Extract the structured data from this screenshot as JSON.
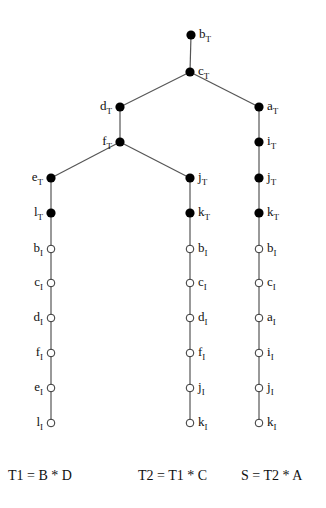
{
  "colors": {
    "line": "#555555",
    "filled_node": "#000000",
    "open_node_stroke": "#333333",
    "text": "#111111"
  },
  "nodes": [
    {
      "id": "bT",
      "letter": "b",
      "sub": "T",
      "x": 191,
      "y": 35,
      "filled": true,
      "label_side": "right"
    },
    {
      "id": "cT",
      "letter": "c",
      "sub": "T",
      "x": 190,
      "y": 72,
      "filled": true,
      "label_side": "right"
    },
    {
      "id": "dT",
      "letter": "d",
      "sub": "T",
      "x": 120,
      "y": 107,
      "filled": true,
      "label_side": "left"
    },
    {
      "id": "fT",
      "letter": "f",
      "sub": "T",
      "x": 120,
      "y": 142,
      "filled": true,
      "label_side": "left"
    },
    {
      "id": "eT",
      "letter": "e",
      "sub": "T",
      "x": 51,
      "y": 178,
      "filled": true,
      "label_side": "left"
    },
    {
      "id": "lT",
      "letter": "l",
      "sub": "T",
      "x": 51,
      "y": 213,
      "filled": true,
      "label_side": "left"
    },
    {
      "id": "bI1",
      "letter": "b",
      "sub": "I",
      "x": 51,
      "y": 249,
      "filled": false,
      "label_side": "left"
    },
    {
      "id": "cI1",
      "letter": "c",
      "sub": "I",
      "x": 51,
      "y": 283,
      "filled": false,
      "label_side": "left"
    },
    {
      "id": "dI1",
      "letter": "d",
      "sub": "I",
      "x": 51,
      "y": 318,
      "filled": false,
      "label_side": "left"
    },
    {
      "id": "fI1",
      "letter": "f",
      "sub": "I",
      "x": 51,
      "y": 353,
      "filled": false,
      "label_side": "left"
    },
    {
      "id": "eI1",
      "letter": "e",
      "sub": "I",
      "x": 51,
      "y": 388,
      "filled": false,
      "label_side": "left"
    },
    {
      "id": "lI1",
      "letter": "l",
      "sub": "I",
      "x": 51,
      "y": 423,
      "filled": false,
      "label_side": "left"
    },
    {
      "id": "jT",
      "letter": "j",
      "sub": "T",
      "x": 190,
      "y": 178,
      "filled": true,
      "label_side": "right"
    },
    {
      "id": "kT",
      "letter": "k",
      "sub": "T",
      "x": 190,
      "y": 213,
      "filled": true,
      "label_side": "right"
    },
    {
      "id": "bI2",
      "letter": "b",
      "sub": "I",
      "x": 190,
      "y": 249,
      "filled": false,
      "label_side": "right"
    },
    {
      "id": "cI2",
      "letter": "c",
      "sub": "I",
      "x": 190,
      "y": 283,
      "filled": false,
      "label_side": "right"
    },
    {
      "id": "dI2",
      "letter": "d",
      "sub": "I",
      "x": 190,
      "y": 318,
      "filled": false,
      "label_side": "right"
    },
    {
      "id": "fI2",
      "letter": "f",
      "sub": "I",
      "x": 190,
      "y": 353,
      "filled": false,
      "label_side": "right"
    },
    {
      "id": "jI2",
      "letter": "j",
      "sub": "I",
      "x": 190,
      "y": 388,
      "filled": false,
      "label_side": "right"
    },
    {
      "id": "kI2",
      "letter": "k",
      "sub": "I",
      "x": 190,
      "y": 423,
      "filled": false,
      "label_side": "right"
    },
    {
      "id": "aT",
      "letter": "a",
      "sub": "T",
      "x": 259,
      "y": 107,
      "filled": true,
      "label_side": "right"
    },
    {
      "id": "iT",
      "letter": "i",
      "sub": "T",
      "x": 259,
      "y": 142,
      "filled": true,
      "label_side": "right"
    },
    {
      "id": "jT3",
      "letter": "j",
      "sub": "T",
      "x": 259,
      "y": 178,
      "filled": true,
      "label_side": "right"
    },
    {
      "id": "kT3",
      "letter": "k",
      "sub": "T",
      "x": 259,
      "y": 213,
      "filled": true,
      "label_side": "right"
    },
    {
      "id": "bI3",
      "letter": "b",
      "sub": "I",
      "x": 259,
      "y": 249,
      "filled": false,
      "label_side": "right"
    },
    {
      "id": "cI3",
      "letter": "c",
      "sub": "I",
      "x": 259,
      "y": 283,
      "filled": false,
      "label_side": "right"
    },
    {
      "id": "aI3",
      "letter": "a",
      "sub": "I",
      "x": 259,
      "y": 318,
      "filled": false,
      "label_side": "right"
    },
    {
      "id": "iI3",
      "letter": "i",
      "sub": "I",
      "x": 259,
      "y": 353,
      "filled": false,
      "label_side": "right"
    },
    {
      "id": "jI3",
      "letter": "j",
      "sub": "I",
      "x": 259,
      "y": 388,
      "filled": false,
      "label_side": "right"
    },
    {
      "id": "kI3",
      "letter": "k",
      "sub": "I",
      "x": 259,
      "y": 423,
      "filled": false,
      "label_side": "right"
    }
  ],
  "edges": [
    [
      "bT",
      "cT"
    ],
    [
      "cT",
      "dT"
    ],
    [
      "cT",
      "aT"
    ],
    [
      "dT",
      "fT"
    ],
    [
      "fT",
      "eT"
    ],
    [
      "fT",
      "jT"
    ],
    [
      "eT",
      "lT"
    ],
    [
      "lT",
      "bI1"
    ],
    [
      "bI1",
      "cI1"
    ],
    [
      "cI1",
      "dI1"
    ],
    [
      "dI1",
      "fI1"
    ],
    [
      "fI1",
      "eI1"
    ],
    [
      "eI1",
      "lI1"
    ],
    [
      "jT",
      "kT"
    ],
    [
      "kT",
      "bI2"
    ],
    [
      "bI2",
      "cI2"
    ],
    [
      "cI2",
      "dI2"
    ],
    [
      "dI2",
      "fI2"
    ],
    [
      "fI2",
      "jI2"
    ],
    [
      "jI2",
      "kI2"
    ],
    [
      "aT",
      "iT"
    ],
    [
      "iT",
      "jT3"
    ],
    [
      "jT3",
      "kT3"
    ],
    [
      "kT3",
      "bI3"
    ],
    [
      "bI3",
      "cI3"
    ],
    [
      "cI3",
      "aI3"
    ],
    [
      "aI3",
      "iI3"
    ],
    [
      "iI3",
      "jI3"
    ],
    [
      "jI3",
      "kI3"
    ]
  ],
  "formulas": [
    {
      "text": "T1 = B * D",
      "x": 8,
      "y": 480
    },
    {
      "text": "T2 = T1 * C",
      "x": 138,
      "y": 480
    },
    {
      "text": "S = T2 * A",
      "x": 241,
      "y": 480
    }
  ]
}
